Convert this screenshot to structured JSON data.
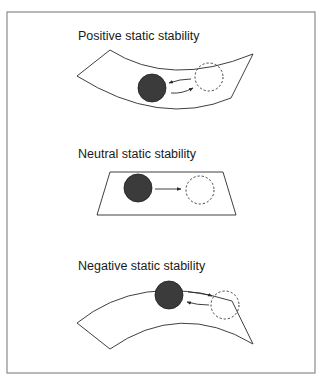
{
  "figure": {
    "frame_color": "#8a8a8a",
    "ball_color": "#3b3b3b",
    "panels": [
      {
        "id": "positive",
        "title": "Positive static stability",
        "surface": "concave bowl (curved upward)",
        "ball_position": "bottom of bowl",
        "displaced_position": "dashed circle to the right, higher on slope",
        "arrows": [
          "return arrow pointing left toward ball",
          "displacement arrow pointing right"
        ]
      },
      {
        "id": "neutral",
        "title": "Neutral static stability",
        "surface": "flat plane (trapezoid)",
        "ball_position": "left on plane",
        "displaced_position": "dashed circle to the right, same level",
        "arrows": [
          "single arrow pointing right"
        ]
      },
      {
        "id": "negative",
        "title": "Negative static stability",
        "surface": "convex hill (curved downward)",
        "ball_position": "top of hill",
        "displaced_position": "dashed circle to the right, lower on slope",
        "arrows": [
          "displacement arrow pointing right",
          "arrow pointing left toward ball"
        ]
      }
    ]
  }
}
